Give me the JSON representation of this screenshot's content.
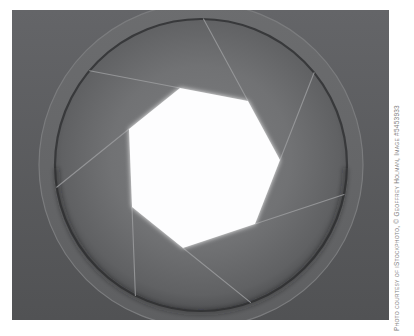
{
  "photo": {
    "colors": {
      "frame_top": "#646568",
      "frame_bottom": "#515254",
      "ring_top": "#6c6d6f",
      "ring_bottom": "#5e5f61",
      "ring_outer_edge": "#7b7c7e",
      "inner_edge": "#38393b",
      "rim_shadow": "#1a1b1d",
      "disc_center": "#7d7e80",
      "disc_mid": "#717274",
      "disc_outer": "#606163",
      "disc_rim": "#47484a",
      "blade_line": "#9b9c9e",
      "aperture": "#fdfdfe"
    }
  },
  "credit": {
    "text": "Photo courtesy of iStockphoto, © Geoffrey Holman, Image #5453933",
    "color": "#7e7e7e"
  }
}
